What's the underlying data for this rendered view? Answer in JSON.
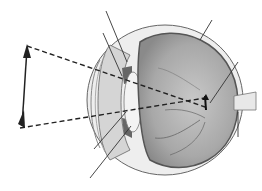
{
  "diagram": {
    "object_arrow": "upright-object-arrow",
    "image_arrow": "inverted-image-on-retina",
    "leader_lines": 6,
    "colors": {
      "background": "#ffffff",
      "line": "#333333",
      "vitreous": "#9a9a9a",
      "vitreous_light": "#c4c4c4",
      "sclera": "#e6e6e6",
      "iris": "#777777"
    }
  }
}
